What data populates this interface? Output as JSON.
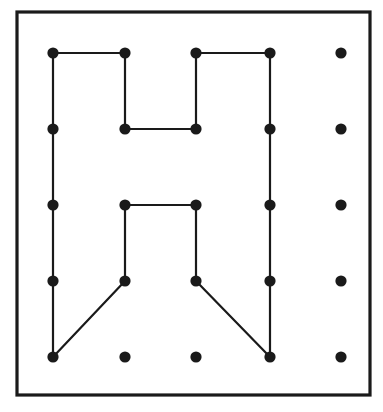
{
  "figure": {
    "canvas": {
      "width": 383,
      "height": 412
    },
    "colors": {
      "background": "#ffffff",
      "frame_stroke": "#1a1a1a",
      "line_stroke": "#1a1a1a",
      "peg_fill": "#1a1a1a"
    },
    "frame": {
      "name": "board-border",
      "x": 17,
      "y": 12,
      "width": 353,
      "height": 383,
      "stroke_width": 3.2
    },
    "grid": {
      "rows": 5,
      "columns": 5,
      "column_x": [
        53,
        125,
        196,
        270,
        341
      ],
      "row_y": [
        53,
        129,
        205,
        281,
        357
      ],
      "peg_radius": 5.6,
      "line_stroke_width": 2.2
    },
    "pegs": [
      {
        "id": "r0c0",
        "row": 0,
        "col": 0,
        "x": 53,
        "y": 53,
        "connected": true
      },
      {
        "id": "r0c1",
        "row": 0,
        "col": 1,
        "x": 125,
        "y": 53,
        "connected": true
      },
      {
        "id": "r0c2",
        "row": 0,
        "col": 2,
        "x": 196,
        "y": 53,
        "connected": true
      },
      {
        "id": "r0c3",
        "row": 0,
        "col": 3,
        "x": 270,
        "y": 53,
        "connected": true
      },
      {
        "id": "r0c4",
        "row": 0,
        "col": 4,
        "x": 341,
        "y": 53,
        "connected": false
      },
      {
        "id": "r1c0",
        "row": 1,
        "col": 0,
        "x": 53,
        "y": 129,
        "connected": true
      },
      {
        "id": "r1c1",
        "row": 1,
        "col": 1,
        "x": 125,
        "y": 129,
        "connected": true
      },
      {
        "id": "r1c2",
        "row": 1,
        "col": 2,
        "x": 196,
        "y": 129,
        "connected": true
      },
      {
        "id": "r1c3",
        "row": 1,
        "col": 3,
        "x": 270,
        "y": 129,
        "connected": true
      },
      {
        "id": "r1c4",
        "row": 1,
        "col": 4,
        "x": 341,
        "y": 129,
        "connected": false
      },
      {
        "id": "r2c0",
        "row": 2,
        "col": 0,
        "x": 53,
        "y": 205,
        "connected": true
      },
      {
        "id": "r2c1",
        "row": 2,
        "col": 1,
        "x": 125,
        "y": 205,
        "connected": true
      },
      {
        "id": "r2c2",
        "row": 2,
        "col": 2,
        "x": 196,
        "y": 205,
        "connected": true
      },
      {
        "id": "r2c3",
        "row": 2,
        "col": 3,
        "x": 270,
        "y": 205,
        "connected": true
      },
      {
        "id": "r2c4",
        "row": 2,
        "col": 4,
        "x": 341,
        "y": 205,
        "connected": false
      },
      {
        "id": "r3c0",
        "row": 3,
        "col": 0,
        "x": 53,
        "y": 281,
        "connected": true
      },
      {
        "id": "r3c1",
        "row": 3,
        "col": 1,
        "x": 125,
        "y": 281,
        "connected": true
      },
      {
        "id": "r3c2",
        "row": 3,
        "col": 2,
        "x": 196,
        "y": 281,
        "connected": true
      },
      {
        "id": "r3c3",
        "row": 3,
        "col": 3,
        "x": 270,
        "y": 281,
        "connected": true
      },
      {
        "id": "r3c4",
        "row": 3,
        "col": 4,
        "x": 341,
        "y": 281,
        "connected": false
      },
      {
        "id": "r4c0",
        "row": 4,
        "col": 0,
        "x": 53,
        "y": 357,
        "connected": true
      },
      {
        "id": "r4c1",
        "row": 4,
        "col": 1,
        "x": 125,
        "y": 357,
        "connected": false
      },
      {
        "id": "r4c2",
        "row": 4,
        "col": 2,
        "x": 196,
        "y": 357,
        "connected": false
      },
      {
        "id": "r4c3",
        "row": 4,
        "col": 3,
        "x": 270,
        "y": 357,
        "connected": true
      },
      {
        "id": "r4c4",
        "row": 4,
        "col": 4,
        "x": 341,
        "y": 357,
        "connected": false
      }
    ],
    "segments": [
      {
        "id": "seg-top-left-horizontal",
        "from": "r0c0",
        "to": "r0c1",
        "x1": 53,
        "y1": 53,
        "x2": 125,
        "y2": 53
      },
      {
        "id": "seg-left-vertical",
        "from": "r0c0",
        "to": "r4c0",
        "x1": 53,
        "y1": 53,
        "x2": 53,
        "y2": 357
      },
      {
        "id": "seg-inner-left-vertical",
        "from": "r0c1",
        "to": "r1c1",
        "x1": 125,
        "y1": 53,
        "x2": 125,
        "y2": 129
      },
      {
        "id": "seg-upper-notch-horizontal",
        "from": "r1c1",
        "to": "r1c2",
        "x1": 125,
        "y1": 129,
        "x2": 196,
        "y2": 129
      },
      {
        "id": "seg-inner-right-vertical",
        "from": "r1c2",
        "to": "r0c2",
        "x1": 196,
        "y1": 129,
        "x2": 196,
        "y2": 53
      },
      {
        "id": "seg-top-right-horizontal",
        "from": "r0c2",
        "to": "r0c3",
        "x1": 196,
        "y1": 53,
        "x2": 270,
        "y2": 53
      },
      {
        "id": "seg-right-vertical",
        "from": "r0c3",
        "to": "r4c3",
        "x1": 270,
        "y1": 53,
        "x2": 270,
        "y2": 357
      },
      {
        "id": "seg-lower-notch-horizontal",
        "from": "r2c1",
        "to": "r2c2",
        "x1": 125,
        "y1": 205,
        "x2": 196,
        "y2": 205
      },
      {
        "id": "seg-lower-left-vertical",
        "from": "r2c1",
        "to": "r3c1",
        "x1": 125,
        "y1": 205,
        "x2": 125,
        "y2": 281
      },
      {
        "id": "seg-lower-right-vertical",
        "from": "r2c2",
        "to": "r3c2",
        "x1": 196,
        "y1": 205,
        "x2": 196,
        "y2": 281
      },
      {
        "id": "seg-left-diagonal",
        "from": "r3c1",
        "to": "r4c0",
        "x1": 125,
        "y1": 281,
        "x2": 53,
        "y2": 357
      },
      {
        "id": "seg-right-diagonal",
        "from": "r3c2",
        "to": "r4c3",
        "x1": 196,
        "y1": 281,
        "x2": 270,
        "y2": 357
      }
    ]
  }
}
